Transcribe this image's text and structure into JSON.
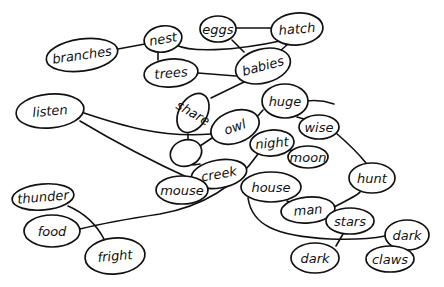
{
  "diagram": {
    "type": "hand-drawn concept map (word web)",
    "stroke_color": "#111111",
    "background": "#ffffff",
    "nodes": [
      {
        "id": "branches",
        "label": "branches",
        "cx": 82,
        "cy": 55,
        "rx": 36,
        "ry": 16,
        "rot": -8
      },
      {
        "id": "nest",
        "label": "nest",
        "cx": 163,
        "cy": 39,
        "rx": 19,
        "ry": 13,
        "rot": -10
      },
      {
        "id": "eggs",
        "label": "eggs",
        "cx": 218,
        "cy": 29,
        "rx": 18,
        "ry": 13,
        "rot": 0
      },
      {
        "id": "hatch",
        "label": "hatch",
        "cx": 297,
        "cy": 29,
        "rx": 26,
        "ry": 16,
        "rot": -5
      },
      {
        "id": "trees",
        "label": "trees",
        "cx": 171,
        "cy": 73,
        "rx": 27,
        "ry": 14,
        "rot": -5
      },
      {
        "id": "babies",
        "label": "babies",
        "cx": 263,
        "cy": 66,
        "rx": 28,
        "ry": 17,
        "rot": -15
      },
      {
        "id": "listen",
        "label": "listen",
        "cx": 50,
        "cy": 111,
        "rx": 34,
        "ry": 17,
        "rot": -5
      },
      {
        "id": "share",
        "label": "share",
        "cx": 193,
        "cy": 113,
        "rx": 14,
        "ry": 21,
        "rot": 30
      },
      {
        "id": "owl",
        "label": "owl",
        "cx": 235,
        "cy": 127,
        "rx": 25,
        "ry": 16,
        "rot": -20
      },
      {
        "id": "huge",
        "label": "huge",
        "cx": 285,
        "cy": 101,
        "rx": 23,
        "ry": 17,
        "rot": 0
      },
      {
        "id": "wise",
        "label": "wise",
        "cx": 319,
        "cy": 127,
        "rx": 20,
        "ry": 12,
        "rot": 0
      },
      {
        "id": "night",
        "label": "night",
        "cx": 272,
        "cy": 143,
        "rx": 22,
        "ry": 13,
        "rot": -5
      },
      {
        "id": "blank",
        "label": "",
        "cx": 186,
        "cy": 153,
        "rx": 16,
        "ry": 13,
        "rot": -20
      },
      {
        "id": "moon",
        "label": "moon",
        "cx": 308,
        "cy": 157,
        "rx": 20,
        "ry": 11,
        "rot": 0
      },
      {
        "id": "creek",
        "label": "creek",
        "cx": 219,
        "cy": 174,
        "rx": 28,
        "ry": 14,
        "rot": -10
      },
      {
        "id": "mouse",
        "label": "mouse",
        "cx": 182,
        "cy": 190,
        "rx": 26,
        "ry": 14,
        "rot": 0
      },
      {
        "id": "house",
        "label": "house",
        "cx": 271,
        "cy": 187,
        "rx": 30,
        "ry": 15,
        "rot": 0
      },
      {
        "id": "hunt",
        "label": "hunt",
        "cx": 372,
        "cy": 178,
        "rx": 23,
        "ry": 15,
        "rot": 0
      },
      {
        "id": "thunder",
        "label": "thunder",
        "cx": 43,
        "cy": 197,
        "rx": 31,
        "ry": 13,
        "rot": -5
      },
      {
        "id": "man",
        "label": "man",
        "cx": 308,
        "cy": 210,
        "rx": 27,
        "ry": 13,
        "rot": -5
      },
      {
        "id": "stars",
        "label": "stars",
        "cx": 350,
        "cy": 221,
        "rx": 24,
        "ry": 13,
        "rot": 0
      },
      {
        "id": "food",
        "label": "food",
        "cx": 52,
        "cy": 231,
        "rx": 28,
        "ry": 16,
        "rot": 0
      },
      {
        "id": "dark1",
        "label": "dark",
        "cx": 407,
        "cy": 235,
        "rx": 22,
        "ry": 15,
        "rot": 0
      },
      {
        "id": "fright",
        "label": "fright",
        "cx": 115,
        "cy": 256,
        "rx": 30,
        "ry": 18,
        "rot": -5
      },
      {
        "id": "dark2",
        "label": "dark",
        "cx": 315,
        "cy": 258,
        "rx": 24,
        "ry": 15,
        "rot": 0
      },
      {
        "id": "claws",
        "label": "claws",
        "cx": 390,
        "cy": 259,
        "rx": 24,
        "ry": 13,
        "rot": 0
      }
    ],
    "edges": [
      {
        "from": "branches",
        "to": "nest",
        "d": "M118,49 L145,44"
      },
      {
        "from": "nest",
        "to": "trees",
        "d": "M158,52 L158,60"
      },
      {
        "from": "nest",
        "to": "hatch",
        "d": "M176,45 C190,52 230,52 285,40"
      },
      {
        "from": "eggs",
        "to": "hatch",
        "d": "M236,28 L271,28"
      },
      {
        "from": "eggs",
        "to": "babies",
        "d": "M232,40 L244,52"
      },
      {
        "from": "hatch",
        "to": "babies",
        "d": "M288,44 L280,51"
      },
      {
        "from": "trees",
        "to": "babies",
        "d": "M198,73 L236,76"
      },
      {
        "from": "babies",
        "to": "share",
        "d": "M246,81 L211,98"
      },
      {
        "from": "listen",
        "to": "owl",
        "d": "M84,113 C120,125 160,138 211,134"
      },
      {
        "from": "listen",
        "to": "creek",
        "d": "M80,121 C120,145 160,165 193,180"
      },
      {
        "from": "share",
        "to": "blank",
        "d": "M188,134 L188,140"
      },
      {
        "from": "owl",
        "to": "huge",
        "d": "M256,118 L263,110"
      },
      {
        "from": "owl",
        "to": "blank",
        "d": "M215,136 L200,146"
      },
      {
        "from": "huge",
        "to": "wise",
        "d": "M297,117 L304,119"
      },
      {
        "from": "huge",
        "to": "offscreen",
        "d": "M307,101 C315,100 325,101 334,104"
      },
      {
        "from": "wise",
        "to": "hunt",
        "d": "M336,133 C350,145 362,158 366,163"
      },
      {
        "from": "night",
        "to": "moon",
        "d": "M290,150 L294,151"
      },
      {
        "from": "night",
        "to": "food",
        "d": "M258,154 C240,180 210,205 160,214 C120,220 100,224 80,229"
      },
      {
        "from": "blank",
        "to": "creek",
        "d": "M193,165 L200,164"
      },
      {
        "from": "creek",
        "to": "mouse",
        "d": "M197,181 L196,182"
      },
      {
        "from": "house",
        "to": "man",
        "d": "M287,201 L292,203"
      },
      {
        "from": "man",
        "to": "hunt",
        "d": "M334,207 C348,200 358,195 360,192"
      },
      {
        "from": "house",
        "to": "dark1",
        "d": "M248,198 C252,225 275,236 330,239 C360,240 375,238 385,236"
      },
      {
        "from": "stars",
        "to": "dark2",
        "d": "M343,234 L336,246"
      },
      {
        "from": "dark1",
        "to": "claws",
        "d": "M397,249 L395,247"
      },
      {
        "from": "thunder",
        "to": "fright",
        "d": "M68,206 C82,212 95,222 104,239"
      }
    ]
  },
  "top_strip_text": ""
}
